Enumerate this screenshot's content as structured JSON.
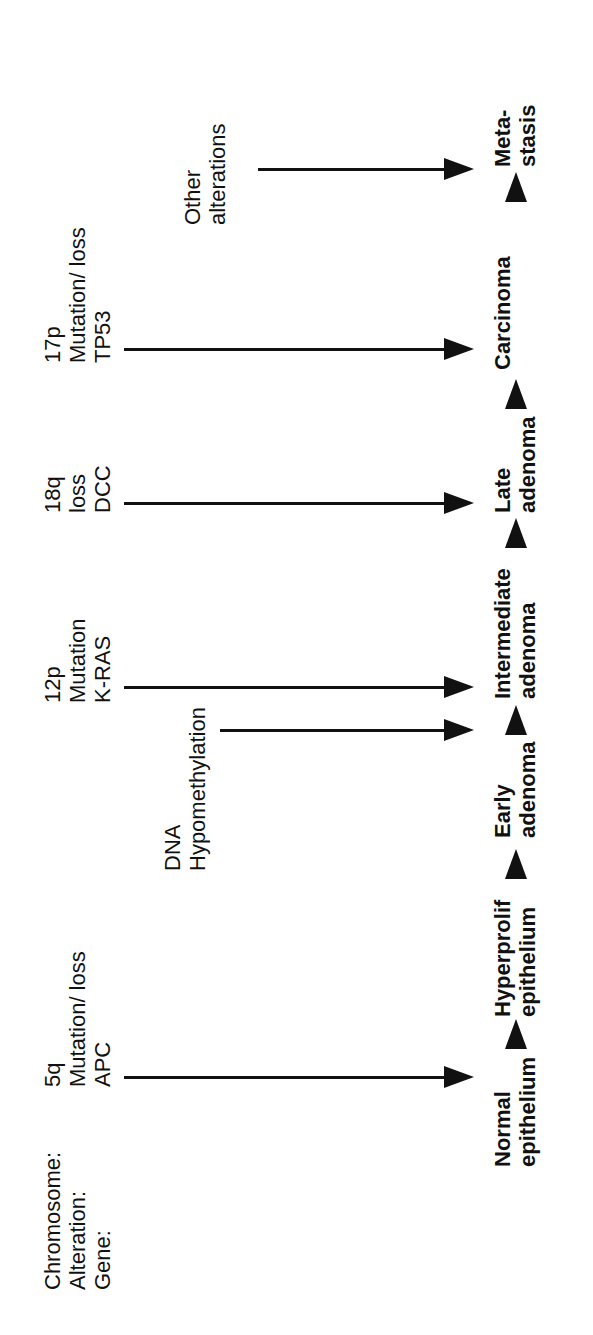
{
  "row_headers": [
    "Chromosome:",
    "Alteration:",
    "Gene:"
  ],
  "events": [
    {
      "chromosome": "5q",
      "alteration": "Mutation/ loss",
      "gene": "APC"
    },
    {
      "line1": "DNA",
      "line2": "Hypomethylation"
    },
    {
      "chromosome": "12p",
      "alteration": "Mutation",
      "gene": "K-RAS"
    },
    {
      "chromosome": "18q",
      "alteration": "loss",
      "gene": "DCC"
    },
    {
      "chromosome": "17p",
      "alteration": "Mutation/ loss",
      "gene": "TP53"
    },
    {
      "line1": "Other",
      "line2": "alterations"
    }
  ],
  "stages": [
    {
      "line1": "Normal",
      "line2": "epithelium"
    },
    {
      "line1": "Hyperprolif",
      "line2": "epithelium"
    },
    {
      "line1": "Early",
      "line2": "adenoma"
    },
    {
      "line1": "Intermediate",
      "line2": "adenoma"
    },
    {
      "line1": "Late",
      "line2": "adenoma"
    },
    {
      "line1": "Carcinoma",
      "line2": ""
    },
    {
      "line1": "Meta-",
      "line2": "stasis"
    }
  ]
}
